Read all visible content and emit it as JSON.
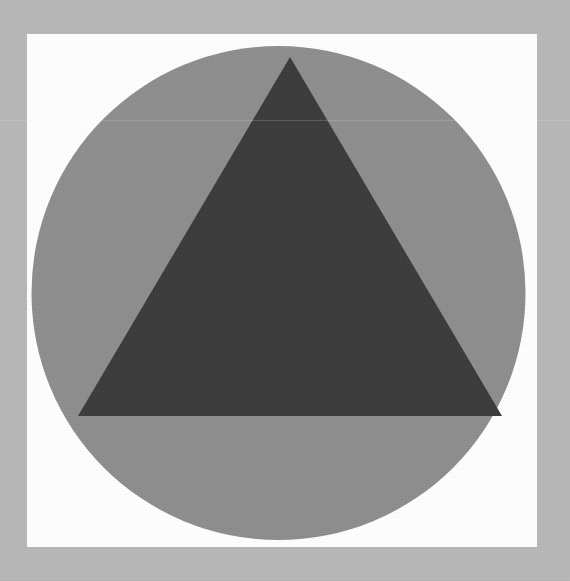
{
  "image": {
    "title": "Geometric Shapes Composition",
    "width": 570,
    "height": 581,
    "description": "A dark gray equilateral-style triangle centered inside a medium gray circle, set on a white square panel with a light gray border surround."
  },
  "colors": {
    "border_background": "#b8b8b8",
    "panel": "#ffffff",
    "circle": "#8e8e8e",
    "triangle": "#3a3a3a",
    "scanline": "rgba(255,255,255,0.18)"
  },
  "shapes": {
    "panel": {
      "name": "white-square-panel",
      "kind": "rect",
      "x": 27,
      "y": 34,
      "width": 510,
      "height": 513,
      "fill": "#ffffff"
    },
    "circle": {
      "name": "gray-circle",
      "kind": "circle",
      "cx": 278.5,
      "cy": 293,
      "r": 247,
      "diameter": 494,
      "fill": "#8e8e8e"
    },
    "triangle": {
      "name": "dark-triangle",
      "kind": "polygon",
      "points": "290,57 502,416 78,416",
      "apex_x": 290,
      "apex_y": 57,
      "base_left_x": 78,
      "base_left_y": 416,
      "base_right_x": 502,
      "base_right_y": 416,
      "base_width": 424,
      "height": 359,
      "fill": "#3a3a3a"
    }
  },
  "artifacts": {
    "scanline_y": 120
  }
}
